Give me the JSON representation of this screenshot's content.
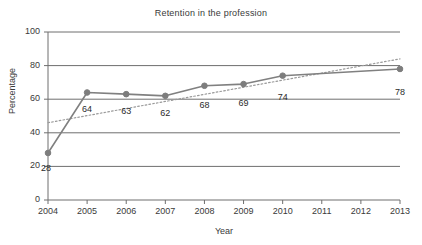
{
  "chart_data": {
    "type": "line",
    "title": "Retention in the profession",
    "xlabel": "Year",
    "ylabel": "Percentage",
    "xlim": [
      2004,
      2013
    ],
    "ylim": [
      0,
      100
    ],
    "grid": true,
    "legend": "none",
    "x_ticks": [
      "2004",
      "2005",
      "2006",
      "2007",
      "2008",
      "2009",
      "2010",
      "2011",
      "2012",
      "2013"
    ],
    "y_ticks": [
      "0",
      "20",
      "40",
      "60",
      "80",
      "100"
    ],
    "categories": [
      2004,
      2005,
      2006,
      2007,
      2008,
      2009,
      2010,
      2011,
      2012,
      2013
    ],
    "series": [
      {
        "name": "Retention",
        "style": "solid-with-markers",
        "color": "#808080",
        "x": [
          2004,
          2005,
          2006,
          2007,
          2008,
          2009,
          2010,
          2013
        ],
        "values": [
          28,
          64,
          63,
          62,
          68,
          69,
          74,
          78
        ],
        "data_labels": [
          "28",
          "64",
          "63",
          "62",
          "68",
          "69",
          "74",
          "78"
        ]
      },
      {
        "name": "Trendline",
        "style": "dotted",
        "color": "#9a9a9a",
        "x": [
          2004,
          2013
        ],
        "values": [
          46,
          84
        ],
        "data_labels": []
      }
    ]
  },
  "colors": {
    "series_line": "#808080",
    "marker": "#7d7d7d",
    "trendline": "#9a9a9a",
    "axis": "#6e6e6e",
    "gridline": "#6e6e6e",
    "text": "#3a3a3a",
    "background": "#ffffff"
  }
}
